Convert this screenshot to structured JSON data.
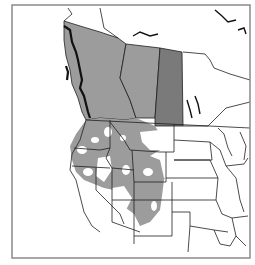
{
  "map": {
    "title": "",
    "frame": {
      "x": 12,
      "y": 5,
      "width": 238,
      "height": 253,
      "stroke": "#8a8a8a"
    },
    "colors": {
      "background": "#ffffff",
      "border_line": "#1e1e1e",
      "range_light": "#9c9c9c",
      "range_dark": "#7a7a7a",
      "water": "#ffffff"
    },
    "regions": [
      {
        "name": "british-columbia",
        "fill": "range_light"
      },
      {
        "name": "alberta",
        "fill": "range_light"
      },
      {
        "name": "saskatchewan",
        "fill": "range_dark"
      },
      {
        "name": "western-us-patchy-range",
        "fill": "range_light"
      }
    ]
  }
}
